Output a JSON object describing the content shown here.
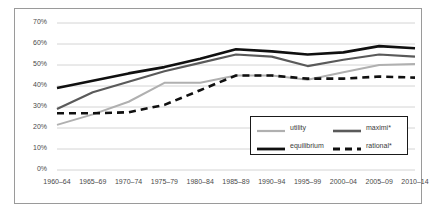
{
  "chart_data": {
    "type": "line",
    "title": "",
    "subtitle": "",
    "xlabel": "",
    "ylabel": "",
    "ylim": [
      0,
      70
    ],
    "ytick_labels": [
      "0%",
      "10%",
      "20%",
      "30%",
      "40%",
      "50%",
      "60%",
      "70%"
    ],
    "ytick_values": [
      0,
      10,
      20,
      30,
      40,
      50,
      60,
      70
    ],
    "grid": "horizontal",
    "legend_position": "inside-lower-right",
    "categories": [
      "1960–64",
      "1965–69",
      "1970–74",
      "1975–79",
      "1980–84",
      "1985–89",
      "1990–94",
      "1995–99",
      "2000–04",
      "2005–09",
      "2010–14"
    ],
    "series": [
      {
        "name": "utility",
        "color": "#b0b0b0",
        "style": "solid",
        "width": 2.0,
        "values": [
          21.5,
          26.5,
          32.5,
          41.5,
          41.5,
          45.0,
          45.0,
          43.0,
          46.5,
          50.0,
          50.5
        ]
      },
      {
        "name": "maximi*",
        "color": "#5a5a5a",
        "style": "solid",
        "width": 2.2,
        "values": [
          29.0,
          37.0,
          42.0,
          47.0,
          51.0,
          55.0,
          54.0,
          49.5,
          52.5,
          55.0,
          54.0
        ]
      },
      {
        "name": "equilibrium",
        "color": "#101010",
        "style": "solid",
        "width": 2.6,
        "values": [
          39.0,
          42.5,
          46.0,
          49.0,
          53.0,
          57.5,
          56.5,
          55.0,
          56.0,
          59.0,
          58.0
        ]
      },
      {
        "name": "rational*",
        "color": "#101010",
        "style": "dashed",
        "width": 2.6,
        "values": [
          27.0,
          27.0,
          27.5,
          31.0,
          38.0,
          45.0,
          45.0,
          43.5,
          43.5,
          44.5,
          44.0
        ]
      }
    ]
  },
  "legend": {
    "entries": [
      {
        "label": "utility"
      },
      {
        "label": "maximi*"
      },
      {
        "label": "equilibrium"
      },
      {
        "label": "rational*"
      }
    ]
  }
}
